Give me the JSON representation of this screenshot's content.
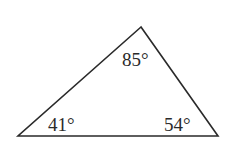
{
  "diagram": {
    "type": "triangle",
    "stroke_color": "#2a2a2a",
    "vertices": {
      "top": {
        "x": 141,
        "y": 27
      },
      "bottom_left": {
        "x": 18,
        "y": 136
      },
      "bottom_right": {
        "x": 218,
        "y": 136
      }
    },
    "angles": {
      "top": "85°",
      "bottom_left": "41°",
      "bottom_right": "54°"
    }
  }
}
